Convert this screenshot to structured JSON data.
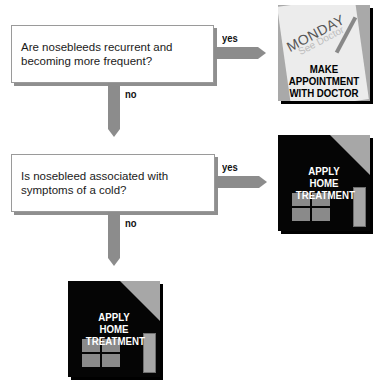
{
  "flowchart": {
    "questions": [
      {
        "text": "Are nosebleeds recurrent and becoming more frequent?",
        "yes_label": "yes",
        "no_label": "no"
      },
      {
        "text": "Is nosebleed associated with symptoms of a cold?",
        "yes_label": "yes",
        "no_label": "no"
      }
    ],
    "outcomes": [
      {
        "icon": "calendar-icon",
        "calendar_day": "MONDAY",
        "calendar_note": "See Doctor",
        "label": "MAKE APPOINTMENT WITH DOCTOR"
      },
      {
        "icon": "house-icon",
        "label": "APPLY HOME TREATMENT"
      },
      {
        "icon": "house-icon",
        "label": "APPLY HOME TREATMENT"
      }
    ],
    "colors": {
      "arrow": "#8c8c8c",
      "box_border": "#9a9a9a",
      "card_dark": "#050505",
      "card_gray": "#a9a9a9"
    }
  }
}
